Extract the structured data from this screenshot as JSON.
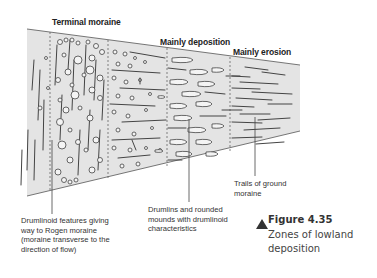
{
  "zones": {
    "terminal_moraine": "Terminal moraine",
    "mainly_deposition": "Mainly deposition",
    "mainly_erosion": "Mainly erosion"
  },
  "annotations": {
    "drumlinoid": [
      "Drumlinoid features giving",
      "way to Rogen moraine",
      "(moraine transverse to the",
      "direction of flow)"
    ],
    "drumlins": [
      "Drumlins and rounded",
      "mounds with drumlinoid",
      "characteristics"
    ],
    "trails": [
      "Trails of ground",
      "moraine"
    ]
  },
  "figure": {
    "icon": "triangle-up-icon",
    "number": "Figure 4.35",
    "title_lines": [
      "Zones of lowland",
      "deposition"
    ]
  },
  "colors": {
    "fill": "#e4e4e4",
    "ink": "#444444",
    "text": "#222222"
  }
}
